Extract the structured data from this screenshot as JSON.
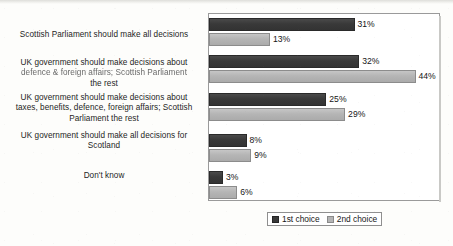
{
  "chart_data": {
    "type": "bar",
    "orientation": "horizontal",
    "title": "",
    "subtitle": "",
    "xlabel": "",
    "ylabel": "",
    "xlim": [
      0,
      49
    ],
    "grid": false,
    "legend_position": "bottom",
    "value_label_suffix": "%",
    "categories": [
      "Scottish Parliament should make all decisions",
      "UK government should make decisions about defence & foreign affairs; Scottish Parliament the rest",
      "UK government should make decisions about taxes, benefits, defence, foreign affairs; Scottish Parliament the rest",
      "UK government should make all decisions for Scotland",
      "Don't know"
    ],
    "category_lines": [
      [
        "Scottish Parliament should make all decisions"
      ],
      [
        "UK government should make decisions about",
        "defence & foreign affairs; Scottish Parliament",
        "the rest"
      ],
      [
        "UK government should make decisions about",
        "taxes, benefits, defence, foreign affairs; Scottish",
        "Parliament the rest"
      ],
      [
        "UK government should make all decisions for",
        "Scotland"
      ],
      [
        "Don't know"
      ]
    ],
    "series": [
      {
        "name": "1st choice",
        "color": "#393939",
        "values": [
          31,
          32,
          25,
          8,
          3
        ],
        "labels": [
          "31%",
          "32%",
          "25%",
          "8%",
          "3%"
        ]
      },
      {
        "name": "2nd choice",
        "color": "#b5b5b5",
        "values": [
          13,
          44,
          29,
          9,
          6
        ],
        "labels": [
          "13%",
          "44%",
          "29%",
          "9%",
          "6%"
        ]
      }
    ]
  },
  "legend": {
    "items": [
      {
        "label": "1st choice",
        "swatch": "dark-gray-swatch-icon"
      },
      {
        "label": "2nd choice",
        "swatch": "light-gray-swatch-icon"
      }
    ]
  }
}
